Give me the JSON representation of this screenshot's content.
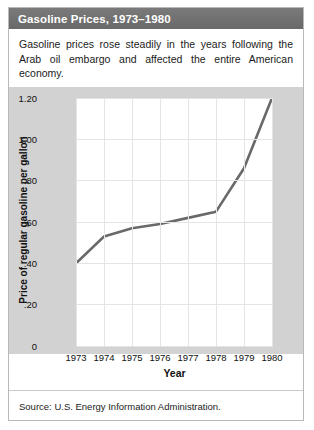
{
  "figure": {
    "title": "Gasoline Prices, 1973–1980",
    "description": "Gasoline prices rose steadily in the years following the Arab oil embargo and affected the entire American economy.",
    "source": "Source: U.S. Energy Information Administration.",
    "title_bar_color": "#6f6f6f",
    "panel_color": "#d2d2d2",
    "line_color": "#696969"
  },
  "chart_data": {
    "type": "line",
    "title": "",
    "xlabel": "Year",
    "ylabel": "Price of regular gasoline per gallon",
    "categories": [
      "1973",
      "1974",
      "1975",
      "1976",
      "1977",
      "1978",
      "1979",
      "1980"
    ],
    "x": [
      1973,
      1974,
      1975,
      1976,
      1977,
      1978,
      1979,
      1980
    ],
    "values": [
      0.4,
      0.53,
      0.57,
      0.59,
      0.62,
      0.65,
      0.86,
      1.2
    ],
    "series": [
      {
        "name": "Price of regular gasoline per gallon",
        "values": [
          0.4,
          0.53,
          0.57,
          0.59,
          0.62,
          0.65,
          0.86,
          1.2
        ]
      }
    ],
    "ylim": [
      0,
      1.2
    ],
    "xlim": [
      1973,
      1980
    ],
    "yticks": [
      0,
      0.2,
      0.4,
      0.6,
      0.8,
      1.0,
      1.2
    ],
    "ytick_labels": [
      "0",
      ".20",
      ".40",
      ".60",
      ".80",
      "1.00",
      "1.20"
    ],
    "xticks": [
      1973,
      1974,
      1975,
      1976,
      1977,
      1978,
      1979,
      1980
    ],
    "xtick_labels": [
      "1973",
      "1974",
      "1975",
      "1976",
      "1977",
      "1978",
      "1979",
      "1980"
    ],
    "grid": true,
    "legend": "none",
    "line_color": "#696969"
  }
}
